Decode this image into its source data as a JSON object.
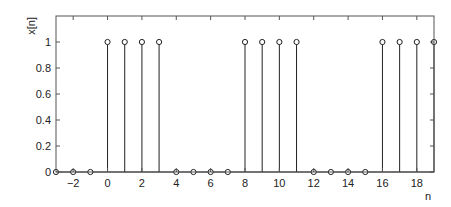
{
  "chart_data": {
    "type": "stem",
    "title": "",
    "xlabel": "n",
    "ylabel": "x[n]",
    "x": [
      -3,
      -2,
      -1,
      0,
      1,
      2,
      3,
      4,
      5,
      6,
      7,
      8,
      9,
      10,
      11,
      12,
      13,
      14,
      15,
      16,
      17,
      18,
      19
    ],
    "values": [
      0,
      0,
      0,
      1,
      1,
      1,
      1,
      0,
      0,
      0,
      0,
      1,
      1,
      1,
      1,
      0,
      0,
      0,
      0,
      1,
      1,
      1,
      1
    ],
    "xlim": [
      -3,
      19
    ],
    "ylim": [
      0,
      1.2
    ],
    "xticks": [
      -2,
      0,
      2,
      4,
      6,
      8,
      10,
      12,
      14,
      16,
      18
    ],
    "xtick_labels": [
      "−2",
      "0",
      "2",
      "4",
      "6",
      "8",
      "10",
      "12",
      "14",
      "16",
      "18"
    ],
    "yticks": [
      0,
      0.2,
      0.4,
      0.6,
      0.8,
      1
    ],
    "ytick_labels": [
      "0",
      "0.2",
      "0.4",
      "0.6",
      "0.8",
      "1"
    ],
    "grid": false,
    "legend": null,
    "marker": "circle-open",
    "color": "#222222"
  }
}
